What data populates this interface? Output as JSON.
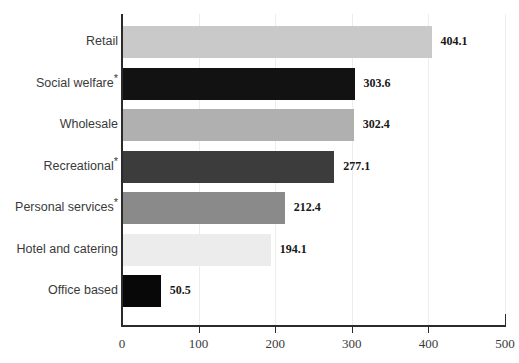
{
  "title_remnant": "",
  "chart_data": {
    "type": "bar",
    "orientation": "horizontal",
    "title": "",
    "xlabel": "",
    "ylabel": "",
    "xlim": [
      0,
      500
    ],
    "xticks": [
      0,
      100,
      200,
      300,
      400,
      500
    ],
    "xtick_labels": [
      "0",
      "100",
      "200",
      "300",
      "400",
      "500"
    ],
    "grid": true,
    "legend": false,
    "categories": [
      "Retail",
      "Social welfare",
      "Wholesale",
      "Recreational",
      "Personal services",
      "Hotel and catering",
      "Office based"
    ],
    "category_footnote_marks": [
      "",
      "*",
      "",
      "*",
      "*",
      "",
      ""
    ],
    "values": [
      404.1,
      303.6,
      302.4,
      277.1,
      212.4,
      194.1,
      50.5
    ],
    "value_labels": [
      "404.1",
      "303.6",
      "302.4",
      "277.1",
      "212.4",
      "194.1",
      "50.5"
    ],
    "bar_colors": [
      "#c9c9c9",
      "#121212",
      "#b0b0b0",
      "#3c3c3c",
      "#8a8a8a",
      "#ececec",
      "#080808"
    ]
  },
  "colors": {
    "axis": "#2b2b2b",
    "gridline": "#ededed",
    "label_text": "#3a3a3a",
    "value_text": "#181818",
    "background": "#ffffff"
  }
}
